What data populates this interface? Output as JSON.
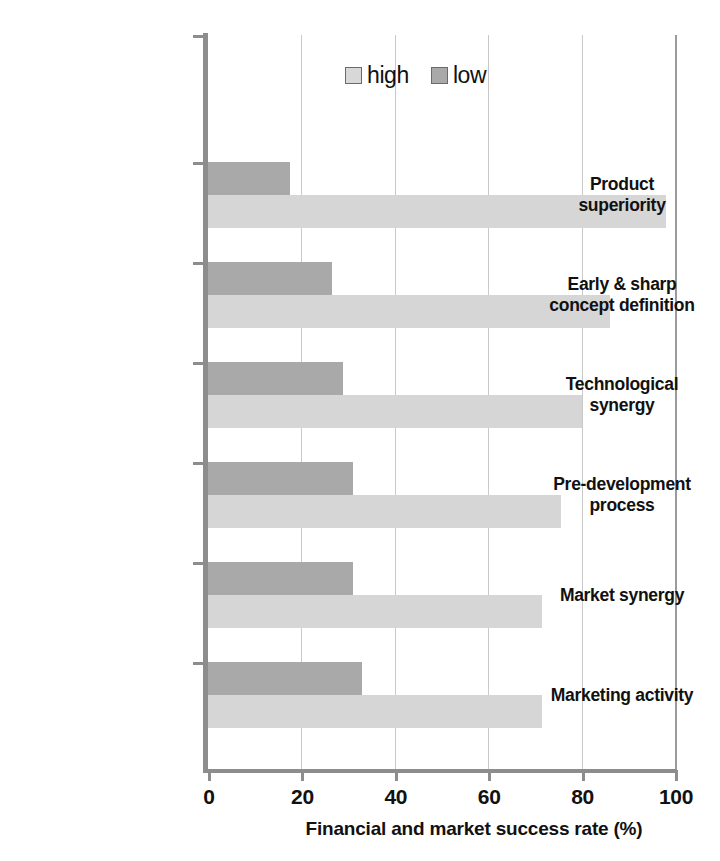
{
  "chart_data": {
    "type": "bar",
    "orientation": "horizontal",
    "title": "",
    "xlabel": "Financial and market success rate (%)",
    "ylabel": "",
    "xlim": [
      0,
      100
    ],
    "xticks": [
      0,
      20,
      40,
      60,
      80,
      100
    ],
    "xtick_labels": [
      "0",
      "20",
      "40",
      "60",
      "80",
      "100"
    ],
    "grid": "vertical",
    "legend_position": "top-center",
    "categories": [
      "Product superiority",
      "Early & sharp concept definition",
      "Technological synergy",
      "Pre-development process",
      "Market synergy",
      "Marketing activity"
    ],
    "category_lines": [
      [
        "Product",
        "superiority"
      ],
      [
        "Early & sharp",
        "concept definition"
      ],
      [
        "Technological",
        "synergy"
      ],
      [
        "Pre-development",
        "process"
      ],
      [
        "Market synergy"
      ],
      [
        "Marketing activity"
      ]
    ],
    "series": [
      {
        "name": "low",
        "color": "#a9a9a9",
        "values": [
          17.5,
          26.5,
          29,
          31,
          31,
          33
        ]
      },
      {
        "name": "high",
        "color": "#d6d6d6",
        "values": [
          98,
          86,
          80,
          75.5,
          71.5,
          71.5
        ]
      }
    ]
  },
  "legend": {
    "items": [
      {
        "label": "high",
        "swatch": "high"
      },
      {
        "label": "low",
        "swatch": "low"
      }
    ]
  },
  "axis": {
    "x_title": "Financial and market success rate (%)"
  }
}
